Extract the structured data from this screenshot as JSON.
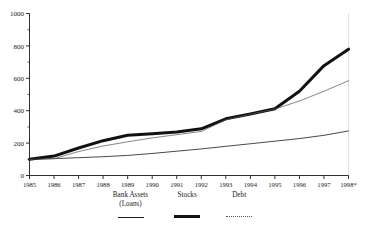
{
  "chart_data": {
    "type": "line",
    "title": "",
    "subtitle": "",
    "xlabel": "",
    "ylabel": "",
    "categories": [
      "1985",
      "1986",
      "1987",
      "1988",
      "1989",
      "1990",
      "1991",
      "1992",
      "1993",
      "1994",
      "1995",
      "1996",
      "1997",
      "1998*"
    ],
    "x_tick_labels": [
      "1985",
      "1986",
      "1987",
      "1988",
      "1989",
      "1990",
      "1991",
      "1992",
      "1993",
      "1994",
      "1995",
      "1996",
      "1997",
      "1998*"
    ],
    "y_tick_labels": [
      "0",
      "200",
      "400",
      "600",
      "800",
      "1000"
    ],
    "y_major_ticks": [
      0,
      200,
      400,
      600,
      800,
      1000
    ],
    "y_minor_ticks": [
      100,
      300,
      500,
      700,
      900
    ],
    "ylim": [
      0,
      1000
    ],
    "xlim": [
      "1985",
      "1998*"
    ],
    "grid": false,
    "legend_position": "bottom",
    "series": [
      {
        "name": "Bank Assets",
        "name_line2": "(Loans)",
        "style": "thin",
        "color": "#1a1a1a",
        "width": 0.8,
        "values": [
          100,
          104,
          110,
          116,
          124,
          136,
          150,
          164,
          180,
          196,
          212,
          228,
          248,
          275
        ]
      },
      {
        "name": "Stocks",
        "name_line2": "",
        "style": "thick",
        "color": "#111111",
        "width": 3.0,
        "values": [
          100,
          120,
          170,
          215,
          248,
          258,
          268,
          288,
          350,
          380,
          412,
          520,
          678,
          780
        ]
      },
      {
        "name": "Debt",
        "name_line2": "",
        "style": "dotted",
        "color": "#555555",
        "width": 0.8,
        "values": [
          100,
          104,
          148,
          182,
          208,
          232,
          252,
          272,
          344,
          378,
          410,
          460,
          520,
          585
        ]
      }
    ]
  },
  "axes": {
    "y_axis_name": "index-value-axis",
    "x_axis_name": "year-axis"
  },
  "legend": {
    "entries": [
      {
        "label": "Bank Assets",
        "label2": "(Loans)"
      },
      {
        "label": "Stocks",
        "label2": ""
      },
      {
        "label": "Debt",
        "label2": ""
      }
    ]
  }
}
